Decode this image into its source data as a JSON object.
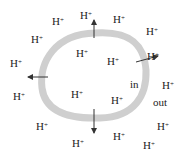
{
  "diagram": {
    "ion_label": "H",
    "ion_charge": "+",
    "region_inside": "in",
    "region_outside": "out",
    "membrane_color": "#cfcfcf",
    "arrow_color": "#333333",
    "ions": [
      {
        "x": 52,
        "y": 16
      },
      {
        "x": 78,
        "y": 10
      },
      {
        "x": 113,
        "y": 14
      },
      {
        "x": 146,
        "y": 26
      },
      {
        "x": 31,
        "y": 34
      },
      {
        "x": 12,
        "y": 58
      },
      {
        "x": 147,
        "y": 51
      },
      {
        "x": 15,
        "y": 91
      },
      {
        "x": 75,
        "y": 47
      },
      {
        "x": 108,
        "y": 58
      },
      {
        "x": 71,
        "y": 89
      },
      {
        "x": 111,
        "y": 93
      },
      {
        "x": 72,
        "y": 82
      },
      {
        "x": 162,
        "y": 79
      },
      {
        "x": 157,
        "y": 123
      },
      {
        "x": 71,
        "y": 77
      },
      {
        "x": 37,
        "y": 120
      },
      {
        "x": 71,
        "y": 138
      },
      {
        "x": 112,
        "y": 131
      },
      {
        "x": 143,
        "y": 141
      }
    ]
  }
}
